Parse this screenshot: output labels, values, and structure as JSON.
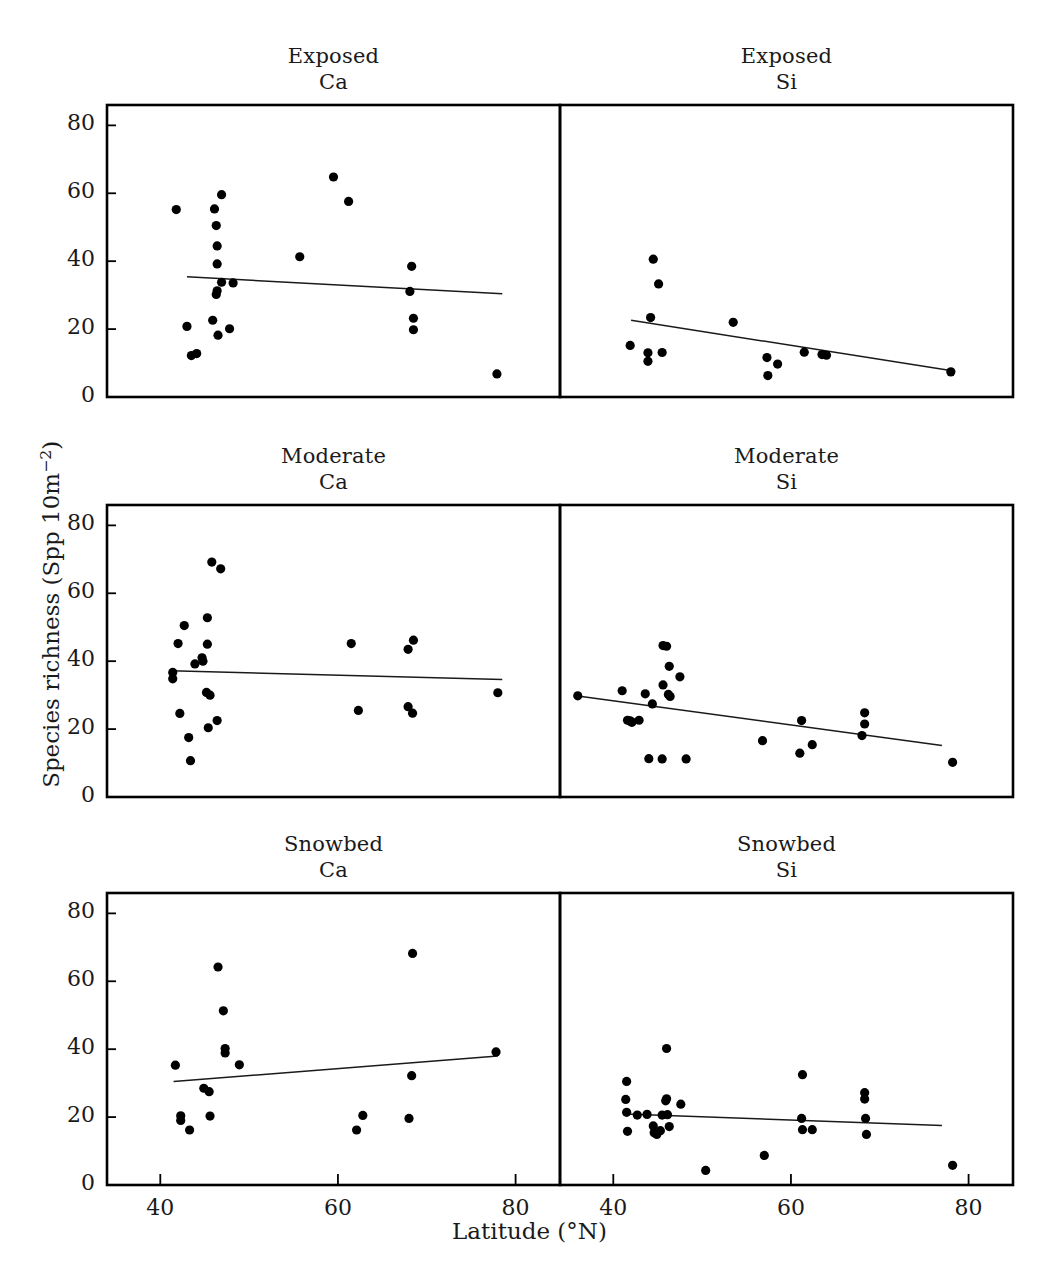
{
  "figure": {
    "ylabel_prefix": "Species richness (Spp 10m",
    "ylabel_exponent": "−2",
    "ylabel_suffix": ")",
    "xlabel": "Latitude (°N)",
    "point_color": "#000000",
    "line_color": "#1a1a1a",
    "frame_color": "#000000"
  },
  "chart_data": [
    {
      "type": "scatter",
      "panel_id": "exposed-ca",
      "title_line1": "Exposed",
      "title_line2": "Ca",
      "xlabel": "Latitude (°N)",
      "ylabel": "Species richness (Spp 10m-2)",
      "xlim": [
        34,
        85
      ],
      "ylim": [
        0,
        86
      ],
      "xticks": [
        40,
        60,
        80
      ],
      "yticks": [
        0,
        20,
        40,
        60,
        80
      ],
      "grid": false,
      "points": [
        {
          "x": 41.8,
          "y": 55.2
        },
        {
          "x": 43.0,
          "y": 20.8
        },
        {
          "x": 43.5,
          "y": 12.2
        },
        {
          "x": 44.1,
          "y": 12.8
        },
        {
          "x": 46.1,
          "y": 55.4
        },
        {
          "x": 46.3,
          "y": 50.5
        },
        {
          "x": 46.4,
          "y": 44.5
        },
        {
          "x": 46.4,
          "y": 39.2
        },
        {
          "x": 46.4,
          "y": 31.3
        },
        {
          "x": 46.3,
          "y": 30.2
        },
        {
          "x": 45.9,
          "y": 22.6
        },
        {
          "x": 46.5,
          "y": 18.2
        },
        {
          "x": 46.9,
          "y": 59.6
        },
        {
          "x": 46.9,
          "y": 33.8
        },
        {
          "x": 48.2,
          "y": 33.6
        },
        {
          "x": 47.8,
          "y": 20.1
        },
        {
          "x": 55.7,
          "y": 41.3
        },
        {
          "x": 59.5,
          "y": 64.8
        },
        {
          "x": 61.2,
          "y": 57.6
        },
        {
          "x": 68.3,
          "y": 38.5
        },
        {
          "x": 68.1,
          "y": 31.1
        },
        {
          "x": 68.5,
          "y": 23.2
        },
        {
          "x": 68.5,
          "y": 19.8
        },
        {
          "x": 77.9,
          "y": 6.8
        }
      ],
      "regression": {
        "x1": 43.0,
        "y1": 35.4,
        "x2": 78.5,
        "y2": 30.4,
        "slope_sign": "negative"
      }
    },
    {
      "type": "scatter",
      "panel_id": "exposed-si",
      "title_line1": "Exposed",
      "title_line2": "Si",
      "xlabel": "Latitude (°N)",
      "ylabel": "Species richness (Spp 10m-2)",
      "xlim": [
        34,
        85
      ],
      "ylim": [
        0,
        86
      ],
      "xticks": [
        40,
        60,
        80
      ],
      "yticks": [
        0,
        20,
        40,
        60,
        80
      ],
      "grid": false,
      "points": [
        {
          "x": 41.9,
          "y": 15.2
        },
        {
          "x": 43.9,
          "y": 13.0
        },
        {
          "x": 43.9,
          "y": 10.5
        },
        {
          "x": 44.2,
          "y": 23.4
        },
        {
          "x": 44.5,
          "y": 40.6
        },
        {
          "x": 45.1,
          "y": 33.3
        },
        {
          "x": 45.5,
          "y": 13.1
        },
        {
          "x": 53.5,
          "y": 22.0
        },
        {
          "x": 57.3,
          "y": 11.6
        },
        {
          "x": 57.4,
          "y": 6.3
        },
        {
          "x": 58.5,
          "y": 9.7
        },
        {
          "x": 61.5,
          "y": 13.2
        },
        {
          "x": 63.5,
          "y": 12.5
        },
        {
          "x": 64.0,
          "y": 12.3
        },
        {
          "x": 78.0,
          "y": 7.4
        }
      ],
      "regression": {
        "x1": 42.0,
        "y1": 22.6,
        "x2": 78.5,
        "y2": 7.6,
        "slope_sign": "negative"
      }
    },
    {
      "type": "scatter",
      "panel_id": "moderate-ca",
      "title_line1": "Moderate",
      "title_line2": "Ca",
      "xlabel": "Latitude (°N)",
      "ylabel": "Species richness (Spp 10m-2)",
      "xlim": [
        34,
        85
      ],
      "ylim": [
        0,
        86
      ],
      "xticks": [
        40,
        60,
        80
      ],
      "yticks": [
        0,
        20,
        40,
        60,
        80
      ],
      "grid": false,
      "points": [
        {
          "x": 41.4,
          "y": 36.7
        },
        {
          "x": 41.4,
          "y": 34.8
        },
        {
          "x": 42.0,
          "y": 45.2
        },
        {
          "x": 42.2,
          "y": 24.6
        },
        {
          "x": 42.7,
          "y": 50.5
        },
        {
          "x": 43.2,
          "y": 17.5
        },
        {
          "x": 43.4,
          "y": 10.7
        },
        {
          "x": 43.9,
          "y": 39.2
        },
        {
          "x": 44.7,
          "y": 41.0
        },
        {
          "x": 44.8,
          "y": 40.0
        },
        {
          "x": 45.3,
          "y": 52.8
        },
        {
          "x": 45.3,
          "y": 45.0
        },
        {
          "x": 45.2,
          "y": 30.8
        },
        {
          "x": 45.6,
          "y": 30.0
        },
        {
          "x": 45.4,
          "y": 20.4
        },
        {
          "x": 45.8,
          "y": 69.2
        },
        {
          "x": 46.8,
          "y": 67.2
        },
        {
          "x": 46.4,
          "y": 22.5
        },
        {
          "x": 61.5,
          "y": 45.2
        },
        {
          "x": 62.3,
          "y": 25.5
        },
        {
          "x": 67.9,
          "y": 43.5
        },
        {
          "x": 68.5,
          "y": 46.2
        },
        {
          "x": 67.9,
          "y": 26.6
        },
        {
          "x": 68.4,
          "y": 24.7
        },
        {
          "x": 78.0,
          "y": 30.7
        }
      ],
      "regression": {
        "x1": 41.2,
        "y1": 37.2,
        "x2": 78.5,
        "y2": 34.6,
        "slope_sign": "negative"
      }
    },
    {
      "type": "scatter",
      "panel_id": "moderate-si",
      "title_line1": "Moderate",
      "title_line2": "Si",
      "xlabel": "Latitude (°N)",
      "ylabel": "Species richness (Spp 10m-2)",
      "xlim": [
        34,
        85
      ],
      "ylim": [
        0,
        86
      ],
      "xticks": [
        40,
        60,
        80
      ],
      "yticks": [
        0,
        20,
        40,
        60,
        80
      ],
      "grid": false,
      "points": [
        {
          "x": 36.0,
          "y": 29.8
        },
        {
          "x": 41.0,
          "y": 31.3
        },
        {
          "x": 41.6,
          "y": 22.6
        },
        {
          "x": 41.9,
          "y": 22.4
        },
        {
          "x": 42.0,
          "y": 22.2
        },
        {
          "x": 42.1,
          "y": 22.0
        },
        {
          "x": 42.9,
          "y": 22.6
        },
        {
          "x": 43.6,
          "y": 30.4
        },
        {
          "x": 44.4,
          "y": 27.4
        },
        {
          "x": 44.0,
          "y": 11.3
        },
        {
          "x": 45.6,
          "y": 33.0
        },
        {
          "x": 45.6,
          "y": 44.6
        },
        {
          "x": 45.5,
          "y": 11.2
        },
        {
          "x": 46.0,
          "y": 44.4
        },
        {
          "x": 46.3,
          "y": 38.5
        },
        {
          "x": 46.2,
          "y": 30.2
        },
        {
          "x": 46.4,
          "y": 29.6
        },
        {
          "x": 47.5,
          "y": 35.4
        },
        {
          "x": 48.2,
          "y": 11.2
        },
        {
          "x": 56.8,
          "y": 16.6
        },
        {
          "x": 61.2,
          "y": 22.5
        },
        {
          "x": 61.0,
          "y": 12.9
        },
        {
          "x": 62.4,
          "y": 15.4
        },
        {
          "x": 68.3,
          "y": 24.8
        },
        {
          "x": 68.3,
          "y": 21.5
        },
        {
          "x": 68.0,
          "y": 18.1
        },
        {
          "x": 78.2,
          "y": 10.2
        }
      ],
      "regression": {
        "x1": 35.8,
        "y1": 29.8,
        "x2": 77.0,
        "y2": 15.2,
        "slope_sign": "negative"
      }
    },
    {
      "type": "scatter",
      "panel_id": "snowbed-ca",
      "title_line1": "Snowbed",
      "title_line2": "Ca",
      "xlabel": "Latitude (°N)",
      "ylabel": "Species richness (Spp 10m-2)",
      "xlim": [
        34,
        85
      ],
      "ylim": [
        0,
        86
      ],
      "xticks": [
        40,
        60,
        80
      ],
      "yticks": [
        0,
        20,
        40,
        60,
        80
      ],
      "grid": false,
      "points": [
        {
          "x": 41.7,
          "y": 35.3
        },
        {
          "x": 42.3,
          "y": 20.4
        },
        {
          "x": 42.3,
          "y": 19.0
        },
        {
          "x": 43.3,
          "y": 16.2
        },
        {
          "x": 44.9,
          "y": 28.5
        },
        {
          "x": 45.5,
          "y": 27.5
        },
        {
          "x": 45.6,
          "y": 20.3
        },
        {
          "x": 46.5,
          "y": 64.2
        },
        {
          "x": 47.1,
          "y": 51.3
        },
        {
          "x": 47.3,
          "y": 40.2
        },
        {
          "x": 47.3,
          "y": 38.9
        },
        {
          "x": 48.9,
          "y": 35.4
        },
        {
          "x": 62.1,
          "y": 16.2
        },
        {
          "x": 62.8,
          "y": 20.5
        },
        {
          "x": 68.4,
          "y": 68.2
        },
        {
          "x": 68.3,
          "y": 32.2
        },
        {
          "x": 68.0,
          "y": 19.6
        },
        {
          "x": 77.8,
          "y": 39.2
        }
      ],
      "regression": {
        "x1": 41.5,
        "y1": 30.5,
        "x2": 78.0,
        "y2": 38.0,
        "slope_sign": "positive"
      }
    },
    {
      "type": "scatter",
      "panel_id": "snowbed-si",
      "title_line1": "Snowbed",
      "title_line2": "Si",
      "xlabel": "Latitude (°N)",
      "ylabel": "Species richness (Spp 10m-2)",
      "xlim": [
        34,
        85
      ],
      "ylim": [
        0,
        86
      ],
      "xticks": [
        40,
        60,
        80
      ],
      "yticks": [
        0,
        20,
        40,
        60,
        80
      ],
      "grid": false,
      "points": [
        {
          "x": 41.5,
          "y": 30.5
        },
        {
          "x": 41.4,
          "y": 25.2
        },
        {
          "x": 41.5,
          "y": 21.4
        },
        {
          "x": 41.6,
          "y": 15.8
        },
        {
          "x": 42.7,
          "y": 20.6
        },
        {
          "x": 43.8,
          "y": 20.8
        },
        {
          "x": 44.5,
          "y": 17.4
        },
        {
          "x": 44.6,
          "y": 15.4
        },
        {
          "x": 44.8,
          "y": 15.2
        },
        {
          "x": 44.9,
          "y": 14.9
        },
        {
          "x": 45.3,
          "y": 16.0
        },
        {
          "x": 45.5,
          "y": 20.6
        },
        {
          "x": 45.9,
          "y": 24.8
        },
        {
          "x": 46.0,
          "y": 25.4
        },
        {
          "x": 46.0,
          "y": 40.2
        },
        {
          "x": 46.1,
          "y": 20.7
        },
        {
          "x": 46.3,
          "y": 17.2
        },
        {
          "x": 47.6,
          "y": 23.8
        },
        {
          "x": 50.4,
          "y": 4.3
        },
        {
          "x": 57.0,
          "y": 8.7
        },
        {
          "x": 61.3,
          "y": 32.5
        },
        {
          "x": 61.2,
          "y": 19.6
        },
        {
          "x": 61.3,
          "y": 16.3
        },
        {
          "x": 62.4,
          "y": 16.3
        },
        {
          "x": 68.3,
          "y": 27.2
        },
        {
          "x": 68.3,
          "y": 25.3
        },
        {
          "x": 68.4,
          "y": 19.6
        },
        {
          "x": 68.5,
          "y": 14.9
        },
        {
          "x": 78.2,
          "y": 5.8
        }
      ],
      "regression": {
        "x1": 41.3,
        "y1": 20.9,
        "x2": 77.0,
        "y2": 17.5,
        "slope_sign": "negative"
      }
    }
  ]
}
